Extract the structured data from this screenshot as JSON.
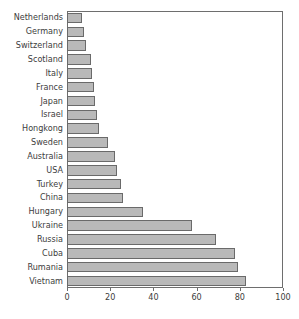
{
  "chart_data": {
    "type": "bar",
    "orientation": "horizontal",
    "title": "",
    "xlabel": "",
    "ylabel": "",
    "xlim": [
      0,
      100
    ],
    "xticks": [
      0,
      20,
      40,
      60,
      80,
      100
    ],
    "xticklabels": [
      "0",
      "20",
      "40",
      "60",
      "80",
      "100"
    ],
    "grid": false,
    "legend": null,
    "bar_fill_color": "#b9b9b9",
    "bar_edge_color": "#6a6a6a",
    "frame_color": "#6e6e6e",
    "categories": [
      "Netherlands",
      "Germany",
      "Switzerland",
      "Scotland",
      "Italy",
      "France",
      "Japan",
      "Israel",
      "Hongkong",
      "Sweden",
      "Australia",
      "USA",
      "Turkey",
      "China",
      "Hungary",
      "Ukraine",
      "Russia",
      "Cuba",
      "Rumania",
      "Vietnam"
    ],
    "values": [
      7,
      8,
      9,
      11,
      11.5,
      12.5,
      13,
      14,
      15,
      19,
      22,
      23,
      25,
      26,
      35,
      58,
      69,
      78,
      79,
      83
    ]
  },
  "caption": {
    "text": ""
  }
}
